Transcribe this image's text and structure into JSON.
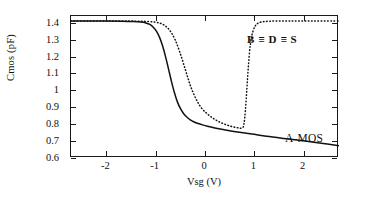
{
  "chart_data": {
    "type": "line",
    "title": "",
    "xlabel": "Vsg (V)",
    "ylabel": "Cmos  (pF)",
    "xlim": [
      -2.72,
      2.72
    ],
    "ylim": [
      0.6,
      1.44
    ],
    "grid": false,
    "legend_position": "inside-annotations",
    "xticks": [
      -2,
      -1,
      0,
      1,
      2
    ],
    "xtick_labels": [
      "-2",
      "-1",
      "0",
      "1",
      "2"
    ],
    "yticks": [
      0.6,
      0.7,
      0.8,
      0.9,
      1.0,
      1.1,
      1.2,
      1.3,
      1.4
    ],
    "ytick_labels": [
      "0.6",
      "0.7",
      "0.8",
      "0.9",
      "1",
      "1.1",
      "1.2",
      "1.3",
      "1.4"
    ],
    "series": [
      {
        "name": "A-MOS",
        "style": "solid",
        "color": "#111111",
        "x": [
          -2.72,
          -2.4,
          -2.0,
          -1.7,
          -1.45,
          -1.3,
          -1.2,
          -1.12,
          -1.05,
          -0.98,
          -0.92,
          -0.86,
          -0.8,
          -0.74,
          -0.68,
          -0.62,
          -0.56,
          -0.5,
          -0.44,
          -0.38,
          -0.3,
          -0.22,
          -0.14,
          -0.05,
          0.05,
          0.18,
          0.32,
          0.5,
          0.7,
          0.95,
          1.25,
          1.6,
          2.0,
          2.4,
          2.72
        ],
        "y": [
          1.41,
          1.41,
          1.41,
          1.409,
          1.407,
          1.404,
          1.399,
          1.39,
          1.374,
          1.348,
          1.312,
          1.262,
          1.198,
          1.126,
          1.052,
          0.986,
          0.932,
          0.893,
          0.865,
          0.845,
          0.826,
          0.813,
          0.804,
          0.796,
          0.788,
          0.779,
          0.771,
          0.761,
          0.752,
          0.742,
          0.729,
          0.716,
          0.702,
          0.686,
          0.672
        ]
      },
      {
        "name": "B ≡ D ≡ S",
        "style": "dotted",
        "color": "#111111",
        "x": [
          -2.72,
          -2.3,
          -1.9,
          -1.55,
          -1.3,
          -1.14,
          -1.02,
          -0.92,
          -0.84,
          -0.76,
          -0.68,
          -0.6,
          -0.52,
          -0.44,
          -0.36,
          -0.28,
          -0.18,
          -0.08,
          0.04,
          0.16,
          0.28,
          0.4,
          0.52,
          0.62,
          0.7,
          0.76,
          0.79,
          0.82,
          0.85,
          0.88,
          0.92,
          0.98,
          1.08,
          1.3,
          1.7,
          2.2,
          2.72
        ],
        "y": [
          1.41,
          1.41,
          1.41,
          1.41,
          1.409,
          1.407,
          1.404,
          1.398,
          1.388,
          1.37,
          1.34,
          1.295,
          1.234,
          1.162,
          1.086,
          1.015,
          0.948,
          0.899,
          0.863,
          0.836,
          0.815,
          0.8,
          0.788,
          0.781,
          0.777,
          0.778,
          0.8,
          0.88,
          1.01,
          1.14,
          1.27,
          1.355,
          1.398,
          1.409,
          1.41,
          1.41,
          1.41
        ]
      }
    ],
    "annotations": [
      {
        "id": "bds",
        "text": "B ≡ D ≡ S",
        "x": 0.85,
        "y": 1.3,
        "bold": true
      },
      {
        "id": "amos",
        "text": "A-MOS",
        "x": 1.62,
        "y": 0.8,
        "bold": false
      }
    ]
  }
}
